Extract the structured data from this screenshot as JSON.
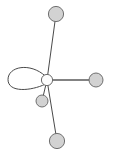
{
  "figure": {
    "title": "",
    "type": "graph-diagram",
    "width": 116,
    "height": 154,
    "background_color": "#ffffff"
  },
  "chart_data": {
    "type": "diagram",
    "subtype": "node-link-graph",
    "title": "",
    "xlabel": "",
    "ylabel": "",
    "grid": false,
    "legend": null,
    "annotations": [],
    "node_count": 5,
    "edge_count": 5,
    "has_self_loop": true,
    "nodes": [
      {
        "id": "center",
        "label": "",
        "x": 47,
        "y": 80,
        "r": 5.6,
        "fill": "#fdfdfd",
        "stroke": "#6b6b6b",
        "degree": 5,
        "role": "hub"
      },
      {
        "id": "top",
        "label": "",
        "x": 56,
        "y": 14,
        "r": 7.6,
        "fill": "#d2d2d2",
        "stroke": "#6f6f6f",
        "degree": 1,
        "role": "leaf"
      },
      {
        "id": "right",
        "label": "",
        "x": 96,
        "y": 80,
        "r": 7.0,
        "fill": "#d2d2d2",
        "stroke": "#6f6f6f",
        "degree": 1,
        "role": "leaf"
      },
      {
        "id": "bottom",
        "label": "",
        "x": 57,
        "y": 141,
        "r": 7.6,
        "fill": "#d2d2d2",
        "stroke": "#6f6f6f",
        "degree": 1,
        "role": "leaf"
      },
      {
        "id": "lower-inner",
        "label": "",
        "x": 42,
        "y": 101,
        "r": 6.0,
        "fill": "#d2d2d2",
        "stroke": "#6f6f6f",
        "degree": 1,
        "role": "leaf"
      }
    ],
    "edges": [
      {
        "id": "e-center-top",
        "source": "center",
        "target": "top",
        "stroke": "#4a4a4a",
        "width": 1.0,
        "kind": "straight"
      },
      {
        "id": "e-center-right",
        "source": "center",
        "target": "right",
        "stroke": "#5a5a5a",
        "width": 1.6,
        "kind": "straight"
      },
      {
        "id": "e-center-bottom",
        "source": "center",
        "target": "bottom",
        "stroke": "#4a4a4a",
        "width": 1.0,
        "kind": "straight"
      },
      {
        "id": "e-center-lower-inner",
        "source": "center",
        "target": "lower-inner",
        "stroke": "#4a4a4a",
        "width": 1.0,
        "kind": "straight"
      },
      {
        "id": "e-center-self-loop",
        "source": "center",
        "target": "center",
        "stroke": "#4a4a4a",
        "width": 1.0,
        "kind": "self-loop",
        "direction": "left",
        "extent_x": 8
      }
    ]
  }
}
